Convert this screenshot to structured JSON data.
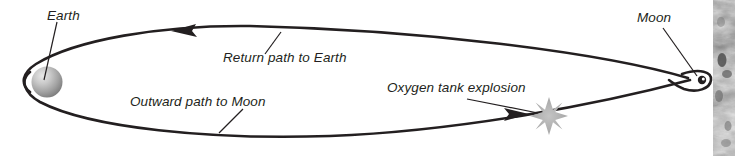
{
  "figure": {
    "background_color": "#ffffff",
    "line_color": "#231f20",
    "label_color": "#231f20",
    "earth_color": "#9d9d9d",
    "moon_color": "#231f20",
    "explosion_color": "#a8a8a8"
  },
  "labels": {
    "earth": "Earth",
    "moon": "Moon",
    "return_path": "Return path to Earth",
    "outward_path": "Outward path to Moon",
    "explosion": "Oxygen tank explosion"
  },
  "side_image": {
    "name": "lunar-surface-photo",
    "description": "Grayscale lunar surface strip"
  }
}
